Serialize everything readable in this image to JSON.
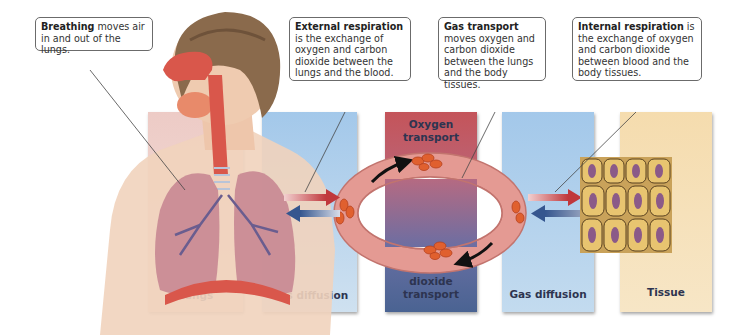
{
  "callouts": {
    "breathing": {
      "bold": "Breathing",
      "rest": " moves air in and out of the lungs."
    },
    "external": {
      "bold": "External respiration",
      "rest": " is the exchange of oxygen and carbon dioxide between the lungs and the blood."
    },
    "transport": {
      "bold": "Gas transport",
      "rest": " moves oxygen and carbon dioxide between the lungs and the body tissues."
    },
    "internal": {
      "bold": "Internal respiration",
      "rest": " is the exchange of oxygen and carbon dioxide between blood and the body tissues."
    }
  },
  "panels": {
    "lungs": {
      "label": "Lungs",
      "color": "#e8b7b0"
    },
    "gas_diffusion_left": {
      "label": "Gas diffusion",
      "color": "#a9cbe8"
    },
    "oxygen_transport": {
      "label": "Oxygen transport",
      "color": "#c4545a"
    },
    "co2_transport": {
      "label": "Carbon dioxide transport",
      "color": "#4f6796"
    },
    "gas_diffusion_right": {
      "label": "Gas diffusion",
      "color": "#a9cbe8"
    },
    "tissue": {
      "label": "Tissue",
      "color": "#f5dfb4"
    }
  },
  "colors": {
    "oxygen_arrow": "#c0383c",
    "co2_arrow": "#35568f",
    "vessel": "#e49a93",
    "blood_cell": "#e0602f",
    "cell_body": "#e8c470",
    "cell_nucleus": "#8b5a88"
  }
}
